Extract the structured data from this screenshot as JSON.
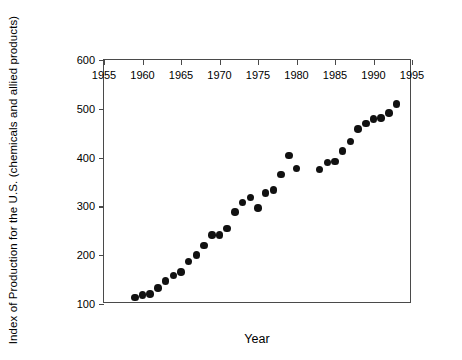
{
  "chart_data": {
    "type": "scatter",
    "title": "",
    "xlabel": "Year",
    "ylabel": "Index  of Production for the U.S. (chemicals and allied products)",
    "xlim": [
      1955,
      1995
    ],
    "ylim": [
      100,
      600
    ],
    "xticks": [
      1955,
      1960,
      1965,
      1970,
      1975,
      1980,
      1985,
      1990,
      1995
    ],
    "xtick_labels": [
      "1955",
      "1960",
      "1965",
      "1970",
      "1975",
      "1980",
      "1985",
      "1990",
      "1995"
    ],
    "yticks": [
      100,
      200,
      300,
      400,
      500,
      600
    ],
    "ytick_labels": [
      "100",
      "200",
      "300",
      "400",
      "500",
      "600"
    ],
    "grid": false,
    "legend": null,
    "marker": "filled-circle",
    "marker_color": "#111111",
    "axis_color": "#4a4a4a",
    "x": [
      1959,
      1960,
      1961,
      1962,
      1963,
      1964,
      1965,
      1966,
      1967,
      1968,
      1969,
      1970,
      1971,
      1972,
      1973,
      1974,
      1975,
      1976,
      1977,
      1978,
      1979,
      1980,
      1983,
      1984,
      1985,
      1986,
      1987,
      1988,
      1989,
      1990,
      1991,
      1992,
      1993
    ],
    "y": [
      113,
      118,
      120,
      133,
      147,
      158,
      165,
      187,
      201,
      220,
      241,
      241,
      255,
      289,
      308,
      318,
      297,
      327,
      333,
      365,
      404,
      378,
      376,
      390,
      392,
      414,
      433,
      459,
      470,
      479,
      481,
      492,
      510
    ],
    "series": [
      {
        "name": "Index of Production",
        "points": [
          {
            "x": 1959,
            "y": 113
          },
          {
            "x": 1960,
            "y": 118
          },
          {
            "x": 1961,
            "y": 120
          },
          {
            "x": 1962,
            "y": 133
          },
          {
            "x": 1963,
            "y": 147
          },
          {
            "x": 1964,
            "y": 158
          },
          {
            "x": 1965,
            "y": 165
          },
          {
            "x": 1966,
            "y": 187
          },
          {
            "x": 1967,
            "y": 201
          },
          {
            "x": 1968,
            "y": 220
          },
          {
            "x": 1969,
            "y": 241
          },
          {
            "x": 1970,
            "y": 241
          },
          {
            "x": 1971,
            "y": 255
          },
          {
            "x": 1972,
            "y": 289
          },
          {
            "x": 1973,
            "y": 308
          },
          {
            "x": 1974,
            "y": 318
          },
          {
            "x": 1975,
            "y": 297
          },
          {
            "x": 1976,
            "y": 327
          },
          {
            "x": 1977,
            "y": 333
          },
          {
            "x": 1978,
            "y": 365
          },
          {
            "x": 1979,
            "y": 404
          },
          {
            "x": 1980,
            "y": 378
          },
          {
            "x": 1983,
            "y": 376
          },
          {
            "x": 1984,
            "y": 390
          },
          {
            "x": 1985,
            "y": 392
          },
          {
            "x": 1986,
            "y": 414
          },
          {
            "x": 1987,
            "y": 433
          },
          {
            "x": 1988,
            "y": 459
          },
          {
            "x": 1989,
            "y": 470
          },
          {
            "x": 1990,
            "y": 479
          },
          {
            "x": 1991,
            "y": 481
          },
          {
            "x": 1992,
            "y": 492
          },
          {
            "x": 1993,
            "y": 510
          }
        ]
      }
    ]
  }
}
